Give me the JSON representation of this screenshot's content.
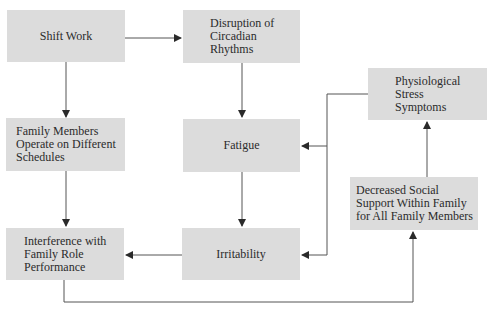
{
  "diagram": {
    "type": "flowchart",
    "nodes": [
      {
        "id": "shift_work",
        "label": "Shift Work"
      },
      {
        "id": "disruption",
        "label": "Disruption of\nCircadian\nRhythms"
      },
      {
        "id": "family_schedules",
        "label": "Family Members\nOperate on Different\nSchedules"
      },
      {
        "id": "fatigue",
        "label": "Fatigue"
      },
      {
        "id": "physiological",
        "label": "Physiological\nStress\nSymptoms"
      },
      {
        "id": "decreased_support",
        "label": "Decreased Social\nSupport Within Family\nfor All Family Members"
      },
      {
        "id": "interference",
        "label": "Interference with\nFamily Role\nPerformance"
      },
      {
        "id": "irritability",
        "label": "Irritability"
      }
    ],
    "edges": [
      {
        "from": "shift_work",
        "to": "disruption"
      },
      {
        "from": "shift_work",
        "to": "family_schedules"
      },
      {
        "from": "disruption",
        "to": "fatigue"
      },
      {
        "from": "family_schedules",
        "to": "interference"
      },
      {
        "from": "fatigue",
        "to": "irritability"
      },
      {
        "from": "irritability",
        "to": "interference"
      },
      {
        "from": "interference",
        "to": "decreased_support"
      },
      {
        "from": "decreased_support",
        "to": "physiological"
      },
      {
        "from": "physiological",
        "to": "fatigue"
      },
      {
        "from": "physiological",
        "to": "irritability"
      }
    ],
    "colors": {
      "box_fill": "#dcdcdc",
      "line": "#3a3a3a",
      "text": "#2b2b2b"
    }
  }
}
